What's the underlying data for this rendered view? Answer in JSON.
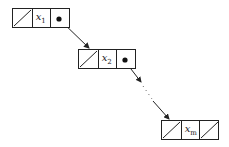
{
  "diagram": {
    "type": "linked-list",
    "nodes": [
      {
        "id": "node-1",
        "label": "x",
        "subscript": "1",
        "left": "null",
        "right": "pointer"
      },
      {
        "id": "node-2",
        "label": "x",
        "subscript": "2",
        "left": "null",
        "right": "pointer"
      },
      {
        "id": "node-m",
        "label": "x",
        "subscript": "m",
        "left": "null",
        "right": "null"
      }
    ],
    "edges": [
      {
        "from": "node-1",
        "to": "node-2",
        "style": "solid-arrow"
      },
      {
        "from": "node-2",
        "to": "node-m",
        "style": "dotted-ellipsis-arrow"
      }
    ],
    "colors": {
      "stroke": "#222222",
      "background": "#ffffff"
    }
  }
}
